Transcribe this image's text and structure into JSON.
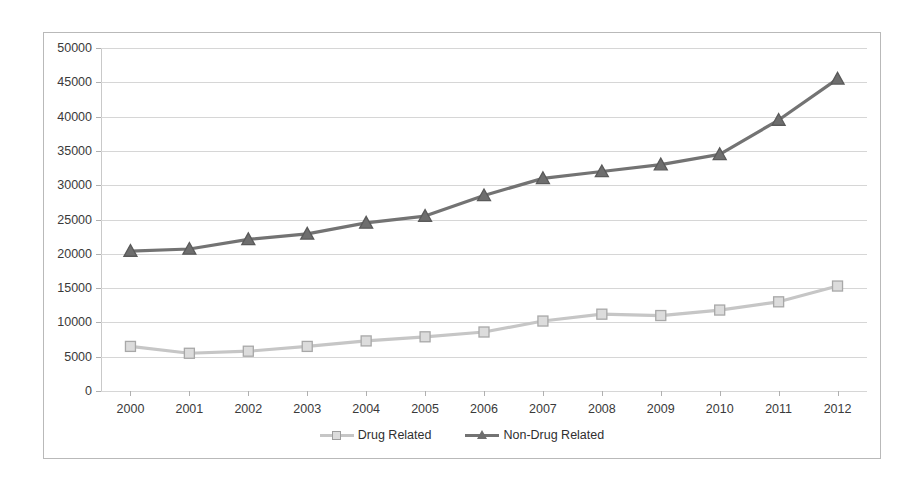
{
  "chart_data": {
    "type": "line",
    "title": "",
    "subtitle": "",
    "xlabel": "",
    "ylabel": "",
    "categories": [
      "2000",
      "2001",
      "2002",
      "2003",
      "2004",
      "2005",
      "2006",
      "2007",
      "2008",
      "2009",
      "2010",
      "2011",
      "2012"
    ],
    "x": [
      2000,
      2001,
      2002,
      2003,
      2004,
      2005,
      2006,
      2007,
      2008,
      2009,
      2010,
      2011,
      2012
    ],
    "series": [
      {
        "name": "Drug Related",
        "color": "#c6c6c6",
        "marker": "square",
        "marker_fill": "#dcdcdc",
        "marker_stroke": "#a8a8a8",
        "values": [
          6500,
          5500,
          5800,
          6500,
          7300,
          7900,
          8600,
          10200,
          11200,
          11000,
          11800,
          13000,
          15300
        ]
      },
      {
        "name": "Non-Drug Related",
        "color": "#737373",
        "marker": "triangle",
        "marker_fill": "#6e6e6e",
        "marker_stroke": "#5a5a5a",
        "values": [
          20400,
          20700,
          22100,
          22900,
          24500,
          25500,
          28500,
          31000,
          32000,
          33000,
          34500,
          39500,
          45500
        ]
      }
    ],
    "ylim": [
      0,
      50000
    ],
    "yticks": [
      0,
      5000,
      10000,
      15000,
      20000,
      25000,
      30000,
      35000,
      40000,
      45000,
      50000
    ],
    "ytick_labels": [
      "0",
      "5000",
      "10000",
      "15000",
      "20000",
      "25000",
      "30000",
      "35000",
      "40000",
      "45000",
      "50000"
    ],
    "xtick_labels": [
      "2000",
      "2001",
      "2002",
      "2003",
      "2004",
      "2005",
      "2006",
      "2007",
      "2008",
      "2009",
      "2010",
      "2011",
      "2012"
    ],
    "grid": true,
    "grid_axis": "y",
    "legend_position": "bottom",
    "legend_entries": [
      "Drug Related",
      "Non-Drug Related"
    ],
    "plot_background": "#ffffff",
    "border_color": "#b9b9b9"
  }
}
